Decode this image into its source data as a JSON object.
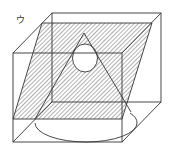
{
  "figure": {
    "label": "ウ",
    "colors": {
      "stroke": "#333333",
      "hatch": "#666666",
      "background": "#ffffff"
    },
    "cube": {
      "back_face": {
        "x1": 52,
        "y1": 13,
        "x2": 161,
        "y2": 102
      },
      "front_face": {
        "x1": 13,
        "y1": 53,
        "x2": 122,
        "y2": 142
      }
    },
    "cutting_plane": {
      "points": [
        [
          42,
          23
        ],
        [
          152,
          23
        ],
        [
          122,
          119
        ],
        [
          13,
          119
        ]
      ],
      "fill": "hatched"
    },
    "cone": {
      "apex": [
        84,
        33
      ],
      "base_ellipse": {
        "cx": 86,
        "cy": 123,
        "rx": 51,
        "ry": 19
      }
    },
    "sphere_section": {
      "cx": 85,
      "cy": 58,
      "rx": 12.5,
      "ry": 14
    }
  }
}
